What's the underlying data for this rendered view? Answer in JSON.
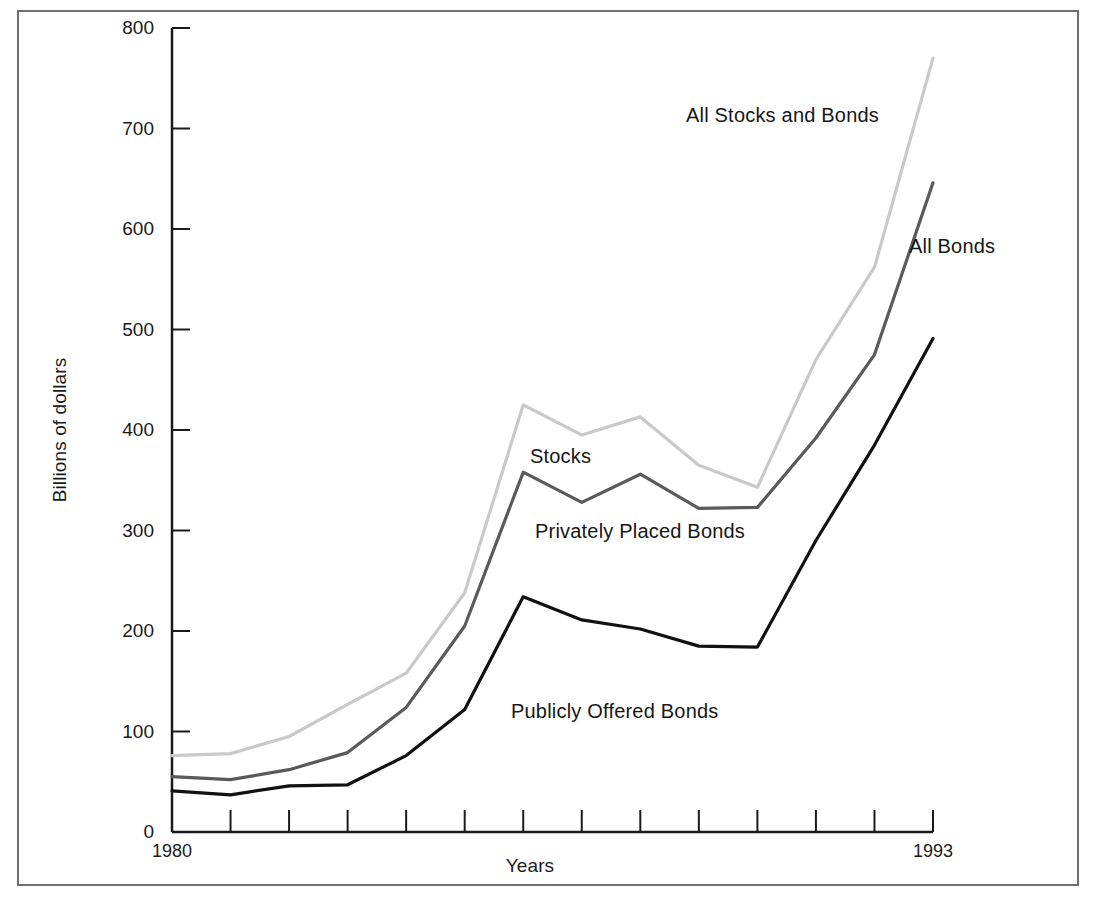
{
  "chart_data": {
    "type": "line",
    "title": "",
    "xlabel": "Years",
    "ylabel": "Billions of dollars",
    "x": [
      1980,
      1981,
      1982,
      1983,
      1984,
      1985,
      1986,
      1987,
      1988,
      1989,
      1990,
      1991,
      1992,
      1993
    ],
    "xlim": [
      1980,
      1993
    ],
    "ylim": [
      0,
      800
    ],
    "y_ticks": [
      0,
      100,
      200,
      300,
      400,
      500,
      600,
      700,
      800
    ],
    "x_tick_labels_visible": [
      "1980",
      "1993"
    ],
    "grid": false,
    "legend": "inline-annotations",
    "series": [
      {
        "name": "All Stocks and Bonds",
        "color": "#c9c9c9",
        "annotation": "All Stocks and Bonds",
        "values": [
          76,
          78,
          95,
          127,
          158,
          238,
          425,
          395,
          413,
          365,
          343,
          470,
          562,
          770
        ]
      },
      {
        "name": "All Bonds",
        "color": "#5a5a5a",
        "annotation": "All Bonds",
        "values": [
          55,
          52,
          62,
          79,
          124,
          205,
          358,
          328,
          356,
          322,
          323,
          392,
          475,
          646
        ]
      },
      {
        "name": "Publicly Offered Bonds",
        "color": "#111111",
        "annotation": "Publicly Offered Bonds",
        "values": [
          41,
          37,
          46,
          47,
          76,
          122,
          234,
          211,
          202,
          185,
          184,
          290,
          385,
          491
        ]
      }
    ],
    "derived_labels": {
      "stocks": "Stocks",
      "privately_placed": "Privately Placed Bonds"
    },
    "annotations": [
      {
        "id": "all-stocks-and-bonds",
        "text": "All Stocks and Bonds",
        "x_px": 686,
        "y_px": 104
      },
      {
        "id": "all-bonds",
        "text": "All Bonds",
        "x_px": 909,
        "y_px": 235
      },
      {
        "id": "stocks",
        "text": "Stocks",
        "x_px": 530,
        "y_px": 445
      },
      {
        "id": "privately-placed-bonds",
        "text": "Privately Placed Bonds",
        "x_px": 535,
        "y_px": 520
      },
      {
        "id": "publicly-offered-bonds",
        "text": "Publicly Offered Bonds",
        "x_px": 511,
        "y_px": 700
      }
    ]
  },
  "axes": {
    "y_title": "Billions of dollars",
    "x_title": "Years",
    "y_tick_labels": [
      "800",
      "700",
      "600",
      "500",
      "400",
      "300",
      "200",
      "100",
      "0"
    ],
    "x_tick_labels": [
      "1980",
      "1993"
    ]
  },
  "colors": {
    "frame": "#6d6f72",
    "axis": "#1a1a1a",
    "series_light": "#c9c9c9",
    "series_mid": "#5a5a5a",
    "series_dark": "#111111",
    "background": "#ffffff"
  }
}
